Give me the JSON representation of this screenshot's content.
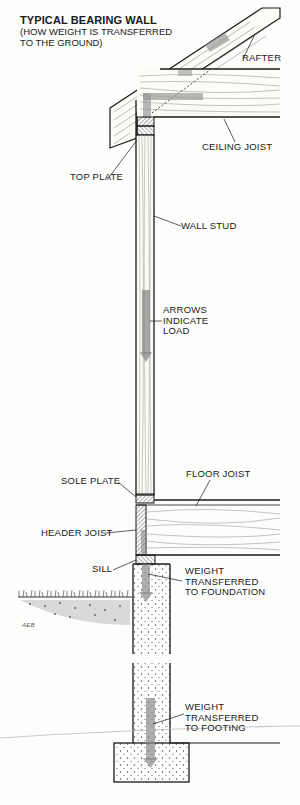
{
  "diagram": {
    "title": "TYPICAL BEARING WALL",
    "subtitle_line1": "(HOW WEIGHT IS TRANSFERRED",
    "subtitle_line2": "TO THE GROUND)",
    "signature": "AEB",
    "labels": {
      "rafter": "RAFTER",
      "ceiling_joist": "CEILING JOIST",
      "top_plate": "TOP PLATE",
      "wall_stud": "WALL STUD",
      "arrows_line1": "ARROWS",
      "arrows_line2": "INDICATE",
      "arrows_line3": "LOAD",
      "floor_joist": "FLOOR JOIST",
      "sole_plate": "SOLE PLATE",
      "header_joist": "HEADER JOIST",
      "sill": "SILL",
      "foundation_line1": "WEIGHT",
      "foundation_line2": "TRANSFERRED",
      "foundation_line3": "TO FOUNDATION",
      "footing_line1": "WEIGHT",
      "footing_line2": "TRANSFERRED",
      "footing_line3": "TO FOOTING"
    },
    "colors": {
      "ink": "#1a1a1a",
      "load_arrow": "#9a9a9a",
      "paper": "#fdfdfb"
    }
  }
}
